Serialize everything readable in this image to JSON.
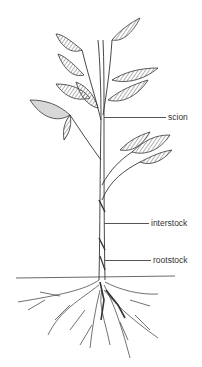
{
  "diagram": {
    "labels": [
      {
        "id": "scion",
        "text": "scion"
      },
      {
        "id": "interstock",
        "text": "interstock"
      },
      {
        "id": "rootstock",
        "text": "rootstock"
      }
    ],
    "colors": {
      "ink": "#333333",
      "leaf_shade": "#888888",
      "background": "#ffffff"
    }
  }
}
